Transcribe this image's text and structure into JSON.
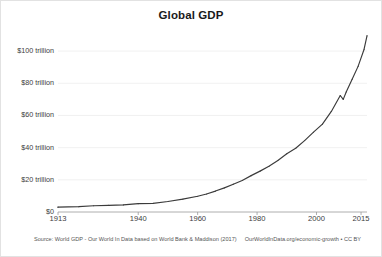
{
  "chart_data": {
    "type": "line",
    "title": "Global GDP",
    "xlabel": "",
    "ylabel": "",
    "xlim": [
      1913,
      2017
    ],
    "ylim": [
      0,
      110
    ],
    "grid": true,
    "legend": false,
    "y_unit": "trillion US$",
    "y_ticks": [
      {
        "value": 0,
        "label": "$0"
      },
      {
        "value": 20,
        "label": "$20 trillion"
      },
      {
        "value": 40,
        "label": "$40 trillion"
      },
      {
        "value": 60,
        "label": "$60 trillion"
      },
      {
        "value": 80,
        "label": "$80 trillion"
      },
      {
        "value": 100,
        "label": "$100 trillion"
      }
    ],
    "x_ticks": [
      {
        "value": 1913,
        "label": "1913"
      },
      {
        "value": 1940,
        "label": "1940"
      },
      {
        "value": 1960,
        "label": "1960"
      },
      {
        "value": 1980,
        "label": "1980"
      },
      {
        "value": 2000,
        "label": "2000"
      },
      {
        "value": 2015,
        "label": "2015"
      }
    ],
    "series": [
      {
        "name": "Global GDP",
        "color": "#3b3b3b",
        "x": [
          1913,
          1920,
          1925,
          1930,
          1935,
          1940,
          1945,
          1950,
          1955,
          1960,
          1963,
          1966,
          1969,
          1972,
          1975,
          1978,
          1981,
          1984,
          1987,
          1990,
          1993,
          1996,
          1999,
          2002,
          2005,
          2008,
          2009,
          2010,
          2012,
          2014,
          2016,
          2017
        ],
        "values": [
          3.0,
          3.3,
          3.9,
          4.1,
          4.4,
          5.2,
          5.4,
          6.5,
          8.0,
          9.8,
          11.2,
          13.0,
          15.0,
          17.3,
          19.6,
          22.6,
          25.4,
          28.4,
          32.0,
          36.2,
          39.6,
          44.4,
          49.6,
          54.6,
          62.5,
          72.4,
          70.0,
          74.6,
          82.5,
          90.5,
          101.0,
          109.5
        ]
      }
    ],
    "annotations": [
      {
        "label": "2009 financial crisis dip",
        "x": 2009,
        "y": 70.0
      }
    ]
  },
  "footer": {
    "source": "Source: World GDP - Our World In Data based on World Bank & Maddison (2017)",
    "attribution": "OurWorldInData.org/economic-growth • CC BY"
  }
}
